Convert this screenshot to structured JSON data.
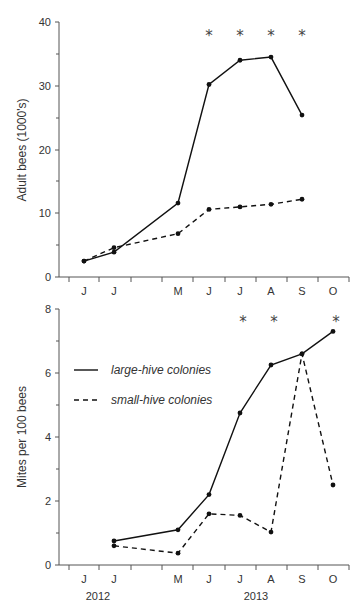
{
  "chart_data": [
    {
      "type": "line",
      "title": "",
      "xlabel": "",
      "ylabel": "Adult bees (1000's)",
      "ylim": [
        0,
        40
      ],
      "yticks": [
        0,
        10,
        20,
        30,
        40
      ],
      "grid": false,
      "categories": [
        "J",
        "J",
        "M",
        "J",
        "J",
        "A",
        "S",
        "O"
      ],
      "series": [
        {
          "name": "large-hive colonies",
          "style": "solid",
          "values": [
            2.5,
            3.9,
            11.6,
            30.2,
            34.0,
            34.5,
            25.4,
            null
          ]
        },
        {
          "name": "small-hive colonies",
          "style": "dashed",
          "values": [
            2.5,
            4.6,
            6.8,
            10.6,
            11.0,
            11.4,
            12.2,
            null
          ]
        }
      ],
      "significance_markers": [
        "J",
        "J",
        "A",
        "S"
      ],
      "annotation": "*"
    },
    {
      "type": "line",
      "title": "",
      "xlabel": "",
      "ylabel": "Mites per 100 bees",
      "ylim": [
        0,
        8
      ],
      "yticks": [
        0,
        2,
        4,
        6,
        8
      ],
      "grid": false,
      "categories": [
        "J",
        "J",
        "M",
        "J",
        "J",
        "A",
        "S",
        "O"
      ],
      "year_labels": [
        "2012",
        "2013"
      ],
      "legend": {
        "position": "upper left",
        "entries": [
          "large-hive colonies",
          "small-hive colonies"
        ]
      },
      "series": [
        {
          "name": "large-hive colonies",
          "style": "solid",
          "values": [
            null,
            0.75,
            1.1,
            2.2,
            4.75,
            6.25,
            6.6,
            7.3
          ]
        },
        {
          "name": "small-hive colonies",
          "style": "dashed",
          "values": [
            null,
            0.6,
            0.37,
            1.6,
            1.55,
            1.03,
            6.6,
            2.5
          ]
        }
      ],
      "significance_markers": [
        "J",
        "A",
        "O"
      ],
      "annotation": "*"
    }
  ],
  "top": {
    "ylabel": "Adult bees (1000's)",
    "yticks": [
      "0",
      "10",
      "20",
      "30",
      "40"
    ],
    "xticks": [
      "J",
      "J",
      "M",
      "J",
      "J",
      "A",
      "S",
      "O"
    ],
    "star": "*"
  },
  "bottom": {
    "ylabel": "Mites per 100 bees",
    "yticks": [
      "0",
      "2",
      "4",
      "6",
      "8"
    ],
    "xticks": [
      "J",
      "J",
      "M",
      "J",
      "J",
      "A",
      "S",
      "O"
    ],
    "year_2012": "2012",
    "year_2013": "2013",
    "legend_large": "large-hive colonies",
    "legend_small": "small-hive colonies",
    "star": "*"
  }
}
